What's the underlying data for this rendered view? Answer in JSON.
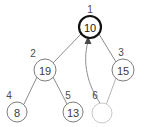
{
  "figure": {
    "background_color": "#ffffff",
    "node_fill_color": "#ffffff",
    "node_stroke_color": "#7d7d7d",
    "root_stroke_color": "#111111",
    "empty_node_stroke_color": "#c9c9c9",
    "edge_color": "#8c8c8c",
    "label_color": "#4a4a4a",
    "value_color": "#3a3a3a",
    "arrow_color": "#8f8f8f"
  },
  "nodes": [
    {
      "index": "1",
      "value": "10",
      "cx": 90,
      "cy": 27,
      "r": 11,
      "label_x": 90,
      "label_y": 9,
      "highlighted": true,
      "empty": false
    },
    {
      "index": "2",
      "value": "19",
      "cx": 45,
      "cy": 70,
      "r": 11,
      "label_x": 33,
      "label_y": 53,
      "highlighted": false,
      "empty": false
    },
    {
      "index": "3",
      "value": "15",
      "cx": 123,
      "cy": 70,
      "r": 11,
      "label_x": 121,
      "label_y": 52,
      "highlighted": false,
      "empty": false
    },
    {
      "index": "4",
      "value": "8",
      "cx": 17,
      "cy": 112,
      "r": 10,
      "label_x": 9,
      "label_y": 95,
      "highlighted": false,
      "empty": false
    },
    {
      "index": "5",
      "value": "13",
      "cx": 73,
      "cy": 112,
      "r": 10,
      "label_x": 68,
      "label_y": 95,
      "highlighted": false,
      "empty": false
    },
    {
      "index": "6",
      "value": "",
      "cx": 102,
      "cy": 113,
      "r": 10,
      "label_x": 95,
      "label_y": 95,
      "highlighted": false,
      "empty": true
    }
  ],
  "edges": [
    {
      "from": "1",
      "to": "2",
      "x1": 81,
      "y1": 34,
      "x2": 53,
      "y2": 63,
      "faint": false
    },
    {
      "from": "1",
      "to": "3",
      "x1": 99,
      "y1": 34,
      "x2": 116,
      "y2": 62,
      "faint": false
    },
    {
      "from": "2",
      "to": "4",
      "x1": 37,
      "y1": 77,
      "x2": 24,
      "y2": 104,
      "faint": false
    },
    {
      "from": "2",
      "to": "5",
      "x1": 53,
      "y1": 77,
      "x2": 67,
      "y2": 104,
      "faint": false
    },
    {
      "from": "3",
      "to": "6",
      "x1": 116,
      "y1": 78,
      "x2": 106,
      "y2": 105,
      "faint": true
    }
  ],
  "swap_arrow": {
    "description": "curved arrow from node 6 up to root node 1",
    "from_index": "6",
    "to_index": "1",
    "path": "M 100 103 C 88 86 82 62 88 42",
    "arrowhead_points": "88,36 84.5,44 91.5,44"
  }
}
